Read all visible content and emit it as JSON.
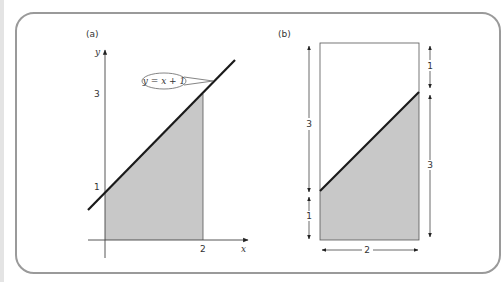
{
  "figure": {
    "panel_a": {
      "label": "(a)",
      "y_axis_label": "y",
      "x_axis_label": "x",
      "y_tick_3": "3",
      "y_tick_1": "1",
      "x_tick_2": "2",
      "callout": "y = x + 1",
      "line_equation": "y = x + 1",
      "shaded_region": "area under y = x + 1 from x = 0 to x = 2"
    },
    "panel_b": {
      "label": "(b)",
      "left_upper_dim": "3",
      "left_lower_dim": "1",
      "right_upper_dim": "1",
      "right_lower_dim": "3",
      "bottom_dim": "2"
    },
    "colors": {
      "shade": "#c8c8c8",
      "line": "#222222",
      "frame": "#9a9a9a"
    }
  }
}
